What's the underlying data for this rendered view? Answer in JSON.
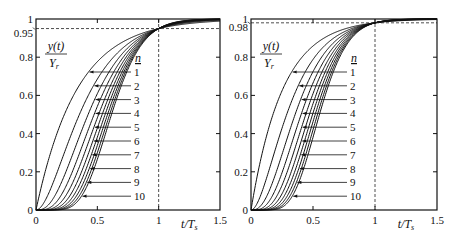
{
  "chart_data": [
    {
      "type": "line",
      "title": "",
      "xlabel": "t/T_s",
      "ylabel": "y(t)/Y_r",
      "xlim": [
        0,
        1.5
      ],
      "ylim": [
        0,
        1
      ],
      "x_ticks": [
        "0",
        "0.5",
        "1",
        "1.5"
      ],
      "x_tick_values": [
        0,
        0.5,
        1,
        1.5
      ],
      "y_ticks": [
        "0",
        "0.2",
        "0.4",
        "0.6",
        "0.8",
        "0.95",
        "1"
      ],
      "y_tick_values": [
        0,
        0.2,
        0.4,
        0.6,
        0.8,
        0.95,
        1
      ],
      "grid": false,
      "reference_lines": {
        "horizontal": 0.95,
        "vertical": 1.0,
        "style": "dashed"
      },
      "legend_title": "n",
      "settling_level": 0.95,
      "model": "n-th order system with n equal real poles (Erlang step response), calibrated so y(T_s) = settling_level",
      "series_names": [
        "1",
        "2",
        "3",
        "4",
        "5",
        "6",
        "7",
        "8",
        "9",
        "10"
      ],
      "approx_values_at_t_0_5": [
        0.78,
        0.7,
        0.66,
        0.63,
        0.61,
        0.59,
        0.58,
        0.57,
        0.56,
        0.55
      ]
    },
    {
      "type": "line",
      "title": "",
      "xlabel": "t/T_s",
      "ylabel": "y(t)/Y_r",
      "xlim": [
        0,
        1.5
      ],
      "ylim": [
        0,
        1
      ],
      "x_ticks": [
        "0",
        "0.5",
        "1",
        "1.5"
      ],
      "x_tick_values": [
        0,
        0.5,
        1,
        1.5
      ],
      "y_ticks": [
        "0",
        "0.2",
        "0.4",
        "0.6",
        "0.8",
        "0.98",
        "1"
      ],
      "y_tick_values": [
        0,
        0.2,
        0.4,
        0.6,
        0.8,
        0.98,
        1
      ],
      "grid": false,
      "reference_lines": {
        "horizontal": 0.98,
        "vertical": 1.0,
        "style": "dashed"
      },
      "legend_title": "n",
      "settling_level": 0.98,
      "model": "n-th order system with n equal real poles (Erlang step response), calibrated so y(T_s) = settling_level",
      "series_names": [
        "1",
        "2",
        "3",
        "4",
        "5",
        "6",
        "7",
        "8",
        "9",
        "10"
      ],
      "approx_values_at_t_0_5": [
        0.86,
        0.78,
        0.73,
        0.69,
        0.66,
        0.64,
        0.62,
        0.61,
        0.6,
        0.59
      ]
    }
  ],
  "panels": [
    {
      "plot_box": {
        "left": 36,
        "top": 19,
        "right": 220,
        "bottom": 210
      },
      "ylabel_num": "y(t)",
      "ylabel_den": "Y",
      "ylabel_den_sub": "r",
      "xlabel_main": "t/T",
      "xlabel_sub": "s",
      "legend_title": "n",
      "legend_x": 138,
      "legend_y_start": 72,
      "legend_dy": 13.8
    },
    {
      "plot_box": {
        "left": 251,
        "top": 19,
        "right": 437,
        "bottom": 210
      },
      "ylabel_num": "y(t)",
      "ylabel_den": "Y",
      "ylabel_den_sub": "r",
      "xlabel_main": "t/T",
      "xlabel_sub": "s",
      "legend_title": "n",
      "legend_x": 354,
      "legend_y_start": 72,
      "legend_dy": 13.8
    }
  ]
}
